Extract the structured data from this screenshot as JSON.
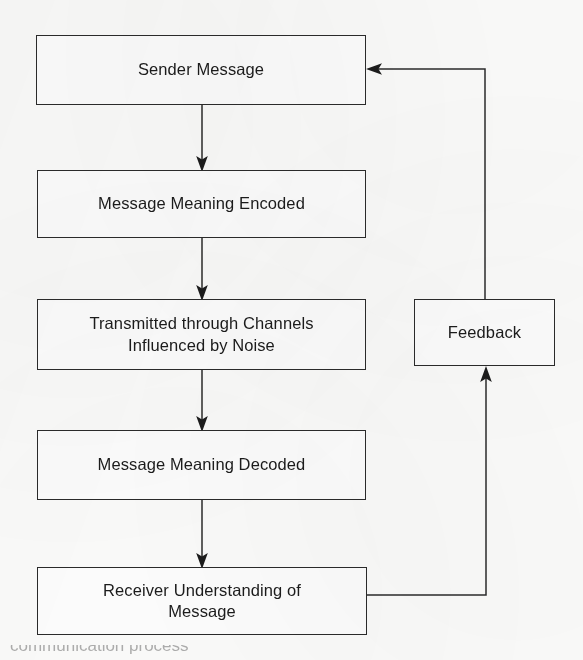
{
  "diagram": {
    "orientation": "vertical-with-feedback-loop",
    "background_color": "#fdfdfc",
    "line_color": "#2b2b2b",
    "text_color": "#1c1c1c",
    "nodes": [
      {
        "id": "sender",
        "label": "Sender Message",
        "shape": "rectangle"
      },
      {
        "id": "encoded",
        "label": "Message Meaning Encoded",
        "shape": "rectangle"
      },
      {
        "id": "transmitted",
        "label": "Transmitted through Channels\nInfluenced by Noise",
        "shape": "rectangle"
      },
      {
        "id": "decoded",
        "label": "Message Meaning Decoded",
        "shape": "rectangle"
      },
      {
        "id": "receiver",
        "label": "Receiver Understanding of\nMessage",
        "shape": "rectangle"
      },
      {
        "id": "feedback",
        "label": "Feedback",
        "shape": "rectangle"
      }
    ],
    "edges": [
      {
        "from": "sender",
        "to": "encoded",
        "style": "straight-arrow",
        "direction": "down"
      },
      {
        "from": "encoded",
        "to": "transmitted",
        "style": "straight-arrow",
        "direction": "down"
      },
      {
        "from": "transmitted",
        "to": "decoded",
        "style": "straight-arrow",
        "direction": "down"
      },
      {
        "from": "decoded",
        "to": "receiver",
        "style": "straight-arrow",
        "direction": "down"
      },
      {
        "from": "receiver",
        "to": "feedback",
        "style": "elbow-arrow",
        "direction": "right-then-up"
      },
      {
        "from": "feedback",
        "to": "sender",
        "style": "elbow-arrow",
        "direction": "up-then-left"
      }
    ]
  },
  "caption": {
    "text": "communication process",
    "note": "cropped at bottom edge of page"
  }
}
